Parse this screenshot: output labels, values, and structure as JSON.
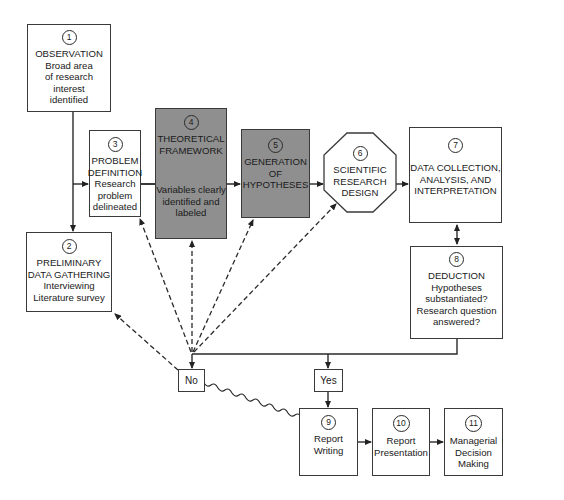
{
  "diagram": {
    "type": "flowchart",
    "nodes": [
      {
        "id": 1,
        "number": "1",
        "title_lines": [
          "OBSERVATION"
        ],
        "desc_lines": [
          "Broad area",
          "of research",
          "interest",
          "identified"
        ],
        "shaded": false
      },
      {
        "id": 2,
        "number": "2",
        "title_lines": [
          "PRELIMINARY",
          "DATA GATHERING"
        ],
        "desc_lines": [
          "Interviewing",
          "Literature survey"
        ],
        "shaded": false
      },
      {
        "id": 3,
        "number": "3",
        "title_lines": [
          "PROBLEM",
          "DEFINITION"
        ],
        "desc_lines": [
          "Research",
          "problem",
          "delineated"
        ],
        "shaded": false
      },
      {
        "id": 4,
        "number": "4",
        "title_lines": [
          "THEORETICAL",
          "FRAMEWORK"
        ],
        "desc_lines": [
          "Variables clearly",
          "identified and",
          "labeled"
        ],
        "shaded": true
      },
      {
        "id": 5,
        "number": "5",
        "title_lines": [
          "GENERATION",
          "OF",
          "HYPOTHESES"
        ],
        "desc_lines": [],
        "shaded": true
      },
      {
        "id": 6,
        "number": "6",
        "title_lines": [
          "SCIENTIFIC",
          "RESEARCH",
          "DESIGN"
        ],
        "desc_lines": [],
        "shaded": false,
        "shape": "octagon"
      },
      {
        "id": 7,
        "number": "7",
        "title_lines": [
          "DATA COLLECTION,",
          "ANALYSIS, AND",
          "INTERPRETATION"
        ],
        "desc_lines": [],
        "shaded": false
      },
      {
        "id": 8,
        "number": "8",
        "title_lines": [
          "DEDUCTION"
        ],
        "desc_lines": [
          "Hypotheses",
          "substantiated?",
          "Research question",
          "answered?"
        ],
        "shaded": false
      },
      {
        "id": 9,
        "number": "9",
        "title_lines": [],
        "desc_lines": [
          "Report",
          "Writing"
        ],
        "shaded": false
      },
      {
        "id": 10,
        "number": "10",
        "title_lines": [],
        "desc_lines": [
          "Report",
          "Presentation"
        ],
        "shaded": false
      },
      {
        "id": 11,
        "number": "11",
        "title_lines": [],
        "desc_lines": [
          "Managerial",
          "Decision",
          "Making"
        ],
        "shaded": false
      }
    ],
    "decision_labels": {
      "no": "No",
      "yes": "Yes"
    },
    "edges": [
      {
        "from": 1,
        "to": 2,
        "style": "solid"
      },
      {
        "from": 1,
        "to": 3,
        "style": "solid"
      },
      {
        "from": 3,
        "to": 5,
        "style": "solid",
        "through": 4
      },
      {
        "from": 5,
        "to": 6,
        "style": "solid"
      },
      {
        "from": 6,
        "to": 7,
        "style": "solid"
      },
      {
        "from": 7,
        "to": 8,
        "style": "solid",
        "bidirectional": true
      },
      {
        "from": 8,
        "to": "yes",
        "style": "solid"
      },
      {
        "from": 8,
        "to": "no",
        "style": "solid"
      },
      {
        "from": "yes",
        "to": 9,
        "style": "solid"
      },
      {
        "from": "no",
        "to": 2,
        "style": "dashed"
      },
      {
        "from": "no",
        "to": 3,
        "style": "dashed"
      },
      {
        "from": "no",
        "to": 4,
        "style": "dashed"
      },
      {
        "from": "no",
        "to": 5,
        "style": "dashed"
      },
      {
        "from": "no",
        "to": 6,
        "style": "dashed"
      },
      {
        "from": "no",
        "to": 9,
        "style": "wavy"
      },
      {
        "from": 9,
        "to": 10,
        "style": "solid"
      },
      {
        "from": 10,
        "to": 11,
        "style": "solid"
      }
    ],
    "colors": {
      "shaded_fill": "#8f8f8f",
      "line": "#2a2a2a",
      "background": "#ffffff"
    }
  }
}
